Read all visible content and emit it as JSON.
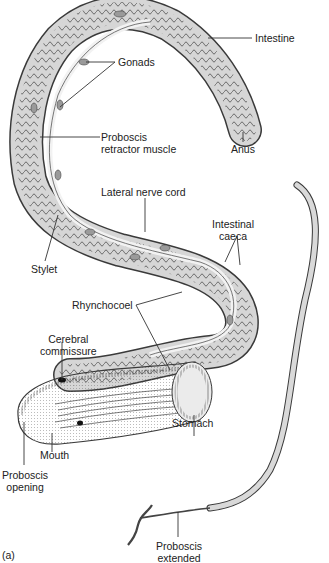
{
  "figure": {
    "panel_label": "(a)",
    "colors": {
      "outline": "#3a3a3a",
      "body_fill": "#d6d6d6",
      "gut_fill": "#c4c4c4",
      "light_fill": "#ebebeb",
      "text": "#222222"
    }
  },
  "labels": {
    "intestine": "Intestine",
    "gonads": "Gonads",
    "proboscis_retractor_line1": "Proboscis",
    "proboscis_retractor_line2": "retractor muscle",
    "anus": "Anus",
    "lateral_nerve_cord": "Lateral nerve cord",
    "intestinal_caeca_line1": "Intestinal",
    "intestinal_caeca_line2": "caeca",
    "stylet": "Stylet",
    "rhynchocoel": "Rhynchocoel",
    "cerebral_commissure_line1": "Cerebral",
    "cerebral_commissure_line2": "commissure",
    "stomach": "Stomach",
    "mouth": "Mouth",
    "proboscis_opening_line1": "Proboscis",
    "proboscis_opening_line2": "opening",
    "proboscis_extended_line1": "Proboscis",
    "proboscis_extended_line2": "extended"
  }
}
